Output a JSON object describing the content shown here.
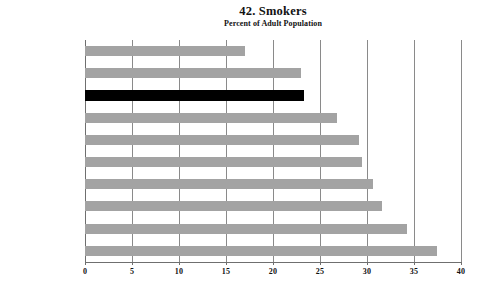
{
  "chart_data": {
    "type": "bar",
    "orientation": "horizontal",
    "title": "42. Smokers",
    "subtitle": "Percent of Adult Population",
    "xlabel": "",
    "ylabel": "",
    "xlim": [
      0,
      40
    ],
    "xticks": [
      "0",
      "5",
      "10",
      "15",
      "20",
      "25",
      "30",
      "35",
      "40"
    ],
    "xtick_values": [
      0,
      5,
      10,
      15,
      20,
      25,
      30,
      35,
      40
    ],
    "grid": "vertical",
    "legend": "none",
    "categories": [
      "Portugal",
      "Finland",
      "United States",
      "France",
      "Austria",
      "Denmark",
      "Ireland",
      "Luxembourg",
      "Germany",
      "Greece"
    ],
    "values": [
      17.0,
      23.0,
      23.3,
      26.8,
      29.1,
      29.5,
      30.6,
      31.6,
      34.3,
      37.4
    ],
    "highlight_category": "United States",
    "colors": {
      "bar": "#a3a3a3",
      "highlight_bar": "#000000",
      "gridline": "#8a8a8a",
      "axis": "#6f6f6f",
      "text": "#111111",
      "background": "#ffffff"
    }
  }
}
